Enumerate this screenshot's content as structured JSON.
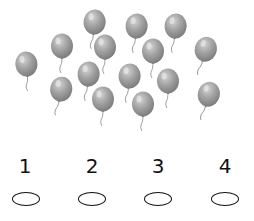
{
  "picture": {
    "subject": "balloons",
    "count": 15,
    "color": "#9a9a9a",
    "balloons": [
      {
        "x": 27,
        "y": 65,
        "tilt": -5
      },
      {
        "x": 62,
        "y": 47,
        "tilt": 0
      },
      {
        "x": 94,
        "y": 23,
        "tilt": 5
      },
      {
        "x": 105,
        "y": 48,
        "tilt": 0
      },
      {
        "x": 88,
        "y": 75,
        "tilt": 5
      },
      {
        "x": 60,
        "y": 90,
        "tilt": 10
      },
      {
        "x": 103,
        "y": 100,
        "tilt": 0
      },
      {
        "x": 136,
        "y": 27,
        "tilt": 5
      },
      {
        "x": 153,
        "y": 52,
        "tilt": 0
      },
      {
        "x": 175,
        "y": 27,
        "tilt": 5
      },
      {
        "x": 129,
        "y": 77,
        "tilt": 5
      },
      {
        "x": 168,
        "y": 82,
        "tilt": 0
      },
      {
        "x": 143,
        "y": 105,
        "tilt": 0
      },
      {
        "x": 204,
        "y": 50,
        "tilt": 15
      },
      {
        "x": 207,
        "y": 95,
        "tilt": 15
      }
    ]
  },
  "choices": [
    {
      "label": "1",
      "x": 25
    },
    {
      "label": "2",
      "x": 92
    },
    {
      "label": "3",
      "x": 158
    },
    {
      "label": "4",
      "x": 225
    }
  ]
}
